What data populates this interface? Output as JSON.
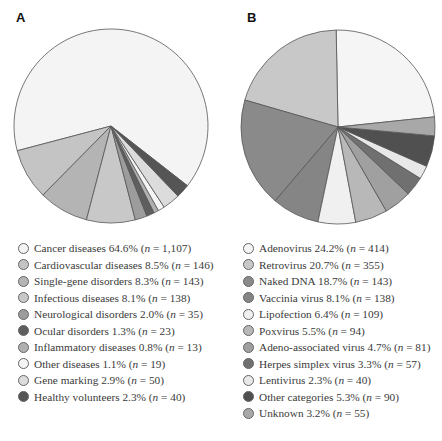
{
  "chart_data": [
    {
      "type": "pie",
      "panel_label": "A",
      "title": "",
      "start_angle_deg": -38,
      "direction": "counterclockwise",
      "center": [
        111,
        126
      ],
      "radius": 97,
      "slices": [
        {
          "label": "Cancer diseases",
          "percent": 64.6,
          "n": "1,107",
          "color": "#f4f4f4"
        },
        {
          "label": "Cardiovascular diseases",
          "percent": 8.5,
          "n": "146",
          "color": "#c4c4c4"
        },
        {
          "label": "Single-gene disorders",
          "percent": 8.3,
          "n": "143",
          "color": "#b4b4b4"
        },
        {
          "label": "Infectious diseases",
          "percent": 8.1,
          "n": "138",
          "color": "#c8c8c8"
        },
        {
          "label": "Neurological disorders",
          "percent": 2.0,
          "n": "35",
          "color": "#9c9c9c"
        },
        {
          "label": "Ocular disorders",
          "percent": 1.3,
          "n": "23",
          "color": "#5e5e5e"
        },
        {
          "label": "Inflammatory diseases",
          "percent": 0.8,
          "n": "13",
          "color": "#b0b0b0"
        },
        {
          "label": "Other diseases",
          "percent": 1.1,
          "n": "19",
          "color": "#f4f4f4"
        },
        {
          "label": "Gene marking",
          "percent": 2.9,
          "n": "50",
          "color": "#dcdcdc"
        },
        {
          "label": "Healthy volunteers",
          "percent": 2.3,
          "n": "40",
          "color": "#555555"
        }
      ]
    },
    {
      "type": "pie",
      "panel_label": "B",
      "title": "",
      "start_angle_deg": 6,
      "direction": "counterclockwise",
      "center": [
        338,
        127
      ],
      "radius": 97,
      "slices": [
        {
          "label": "Adenovirus",
          "percent": 24.2,
          "n": "414",
          "color": "#f5f5f5"
        },
        {
          "label": "Retrovirus",
          "percent": 20.7,
          "n": "355",
          "color": "#c8c8c8"
        },
        {
          "label": "Naked DNA",
          "percent": 18.7,
          "n": "143",
          "color": "#8a8a8a"
        },
        {
          "label": "Vaccinia virus",
          "percent": 8.1,
          "n": "138",
          "color": "#858585"
        },
        {
          "label": "Lipofection",
          "percent": 6.4,
          "n": "109",
          "color": "#f0f0f0"
        },
        {
          "label": "Poxvirus",
          "percent": 5.5,
          "n": "94",
          "color": "#b8b8b8"
        },
        {
          "label": "Adeno-associated virus",
          "percent": 4.7,
          "n": "81",
          "color": "#a0a0a0"
        },
        {
          "label": "Herpes simplex virus",
          "percent": 3.3,
          "n": "57",
          "color": "#707070"
        },
        {
          "label": "Lentivirus",
          "percent": 2.3,
          "n": "40",
          "color": "#e8e8e8"
        },
        {
          "label": "Other categories",
          "percent": 5.3,
          "n": "90",
          "color": "#505050"
        },
        {
          "label": "Unknown",
          "percent": 3.2,
          "n": "55",
          "color": "#a8a8a8"
        }
      ]
    }
  ],
  "panels": {
    "a": {
      "label": "A"
    },
    "b": {
      "label": "B"
    }
  },
  "legend_format": {
    "n_symbol": "n",
    "equals": " = "
  }
}
